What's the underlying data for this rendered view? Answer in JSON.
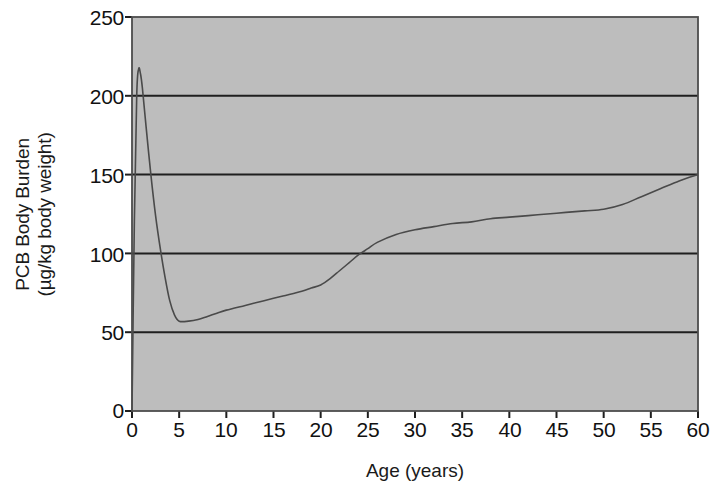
{
  "chart_data": {
    "type": "line",
    "title": "",
    "xlabel": "Age (years)",
    "ylabel": "PCB Body Burden (µg/kg body weight)",
    "ylabel_line1": "PCB Body Burden",
    "ylabel_line2": "(µg/kg body weight)",
    "xlim": [
      0,
      60
    ],
    "ylim": [
      0,
      250
    ],
    "xticks": [
      0,
      5,
      10,
      15,
      20,
      25,
      30,
      35,
      40,
      45,
      50,
      55,
      60
    ],
    "yticks": [
      0,
      50,
      100,
      150,
      200,
      250
    ],
    "xtick_labels": [
      "0",
      "5",
      "10",
      "15",
      "20",
      "25",
      "30",
      "35",
      "40",
      "45",
      "50",
      "55",
      "60"
    ],
    "ytick_labels": [
      "0",
      "50",
      "100",
      "150",
      "200",
      "250"
    ],
    "grid": "horizontal",
    "legend": "none",
    "plot_background_color": "#bdbdbd",
    "line_color": "#4a4a4a",
    "frame_color": "#4d4d4d",
    "gridline_color": "#1f1f1f",
    "series": [
      {
        "name": "PCB body burden",
        "x": [
          0,
          0.25,
          0.5,
          0.7,
          0.9,
          1.1,
          1.5,
          2,
          2.5,
          3,
          3.5,
          4,
          4.5,
          5,
          6,
          7,
          8,
          9,
          10,
          12,
          14,
          16,
          18,
          19,
          20,
          21,
          22,
          23,
          24,
          25,
          26,
          28,
          30,
          32,
          34,
          36,
          38,
          40,
          42,
          44,
          46,
          48,
          50,
          52,
          54,
          56,
          58,
          60
        ],
        "y": [
          0,
          120,
          200,
          217,
          214,
          205,
          180,
          150,
          124,
          103,
          85,
          70,
          61,
          57,
          57,
          58,
          60,
          62,
          64,
          67,
          70,
          73,
          76,
          78,
          80,
          84,
          89,
          94,
          99,
          103,
          107,
          112,
          115,
          117,
          119,
          120,
          122,
          123,
          124,
          125,
          126,
          127,
          128,
          131,
          136,
          141,
          146,
          150
        ]
      }
    ]
  }
}
